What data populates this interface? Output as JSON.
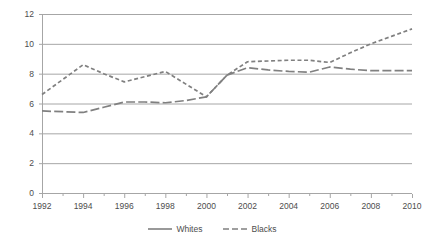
{
  "chart_data": {
    "type": "line",
    "title": "",
    "subtitle": "",
    "xlabel": "",
    "ylabel": "",
    "xlim": [
      1992,
      2010
    ],
    "ylim": [
      0,
      12
    ],
    "ytick_values": [
      0,
      2,
      4,
      6,
      8,
      10,
      12
    ],
    "ytick_labels": [
      "0",
      "2",
      "4",
      "6",
      "8",
      "10",
      "12"
    ],
    "xtick_values": [
      1992,
      1994,
      1996,
      1998,
      2000,
      2002,
      2004,
      2006,
      2008,
      2010
    ],
    "xtick_labels": [
      "1992",
      "1994",
      "1996",
      "1998",
      "2000",
      "2002",
      "2004",
      "2006",
      "2008",
      "2010"
    ],
    "x": [
      1992,
      1993,
      1994,
      1995,
      1996,
      1997,
      1998,
      1999,
      2000,
      2001,
      2002,
      2003,
      2004,
      2005,
      2006,
      2007,
      2008,
      2009,
      2010
    ],
    "grid": "horizontal",
    "legend_position": "bottom",
    "series": [
      {
        "name": "Whites",
        "style": "solid",
        "color": "#808080",
        "values": [
          5.5,
          5.45,
          5.4,
          5.75,
          6.1,
          6.1,
          6.05,
          6.2,
          6.45,
          7.9,
          8.4,
          8.25,
          8.15,
          8.1,
          8.45,
          8.3,
          8.2,
          8.2,
          8.2
        ]
      },
      {
        "name": "Blacks",
        "style": "dashed",
        "color": "#808080",
        "values": [
          6.6,
          7.6,
          8.6,
          8.0,
          7.45,
          7.8,
          8.15,
          7.3,
          6.45,
          7.9,
          8.8,
          8.85,
          8.9,
          8.9,
          8.75,
          9.4,
          10.0,
          10.5,
          11.0
        ]
      }
    ]
  },
  "legend": {
    "items": [
      {
        "label": "Whites",
        "key": "solid-line-key"
      },
      {
        "label": "Blacks",
        "key": "dashed-line-key"
      }
    ]
  },
  "colors": {
    "line": "#808080",
    "grid": "#a6a6a6",
    "axis": "#a6a6a6",
    "text": "#4d4d4d",
    "background": "#ffffff"
  }
}
